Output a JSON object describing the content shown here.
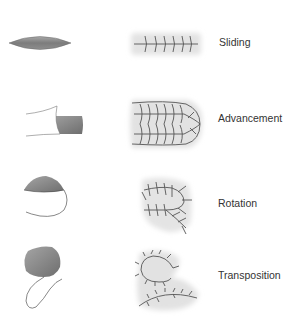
{
  "diagram": {
    "type": "surgical-flap-types",
    "colors": {
      "flap_fill_dark": "#7a7a7a",
      "flap_fill_light": "#b5b5b5",
      "suture_line": "#555555",
      "halo": "#e6e6e6",
      "outline": "#555555",
      "label_text": "#333333"
    },
    "rows": [
      {
        "label": "Sliding",
        "defect_icon": "lens-shaped-defect",
        "closure_icon": "linear-sutured-closure"
      },
      {
        "label": "Advancement",
        "defect_icon": "advancement-flap",
        "closure_icon": "u-shaped-sutured-closure"
      },
      {
        "label": "Rotation",
        "defect_icon": "rotation-flap",
        "closure_icon": "curved-sutured-closure"
      },
      {
        "label": "Transposition",
        "defect_icon": "transposition-flap",
        "closure_icon": "z-shaped-sutured-closure"
      }
    ]
  }
}
